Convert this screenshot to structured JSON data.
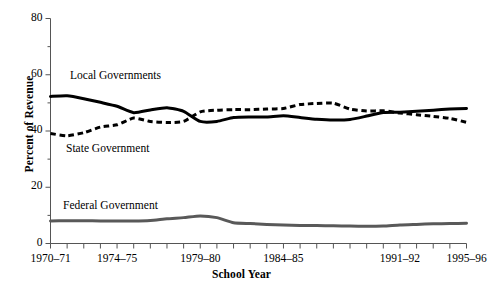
{
  "chart_data": {
    "type": "line",
    "title": "",
    "xlabel": "School Year",
    "ylabel": "Percent of Revenue",
    "ylim": [
      0,
      80
    ],
    "yticks": [
      0,
      20,
      40,
      60,
      80
    ],
    "yminorticks": [
      10,
      30,
      50,
      70
    ],
    "grid": false,
    "legend_position": "inline-annotations",
    "x": [
      "1970-71",
      "1971-72",
      "1972-73",
      "1973-74",
      "1974-75",
      "1975-76",
      "1976-77",
      "1977-78",
      "1978-79",
      "1979-80",
      "1980-81",
      "1981-82",
      "1982-83",
      "1983-84",
      "1984-85",
      "1985-86",
      "1986-87",
      "1987-88",
      "1988-89",
      "1989-90",
      "1990-91",
      "1991-92",
      "1992-93",
      "1993-94",
      "1994-95",
      "1995-96"
    ],
    "xtick_labels": [
      "1970–71",
      "1974–75",
      "1979–80",
      "1984–85",
      "1991–92",
      "1995–96"
    ],
    "xtick_indices": [
      0,
      4,
      9,
      14,
      21,
      25
    ],
    "series": [
      {
        "name": "Local Governments",
        "style": "solid",
        "color": "#000000",
        "width": 3.0,
        "values": [
          52.3,
          52.5,
          51.5,
          50.2,
          48.8,
          46.5,
          47.5,
          48.3,
          47.0,
          43.4,
          43.4,
          44.8,
          45.0,
          45.0,
          45.4,
          44.8,
          44.2,
          43.9,
          44.1,
          45.3,
          46.6,
          46.7,
          47.0,
          47.4,
          47.8,
          48.0
        ]
      },
      {
        "name": "State Government",
        "style": "dashed",
        "color": "#000000",
        "width": 3.0,
        "values": [
          39.1,
          38.3,
          39.4,
          41.4,
          42.2,
          44.6,
          43.4,
          43.0,
          43.4,
          46.8,
          47.4,
          47.6,
          47.6,
          47.8,
          48.0,
          49.4,
          49.8,
          49.9,
          47.8,
          47.1,
          47.2,
          46.4,
          45.8,
          45.2,
          44.5,
          43.1
        ]
      },
      {
        "name": "Federal Government",
        "style": "solid",
        "color": "#595959",
        "width": 3.0,
        "values": [
          8.0,
          8.1,
          8.1,
          8.0,
          8.0,
          8.0,
          8.2,
          8.8,
          9.2,
          9.8,
          9.2,
          7.4,
          7.1,
          6.8,
          6.6,
          6.4,
          6.4,
          6.3,
          6.2,
          6.1,
          6.2,
          6.6,
          6.8,
          7.0,
          7.1,
          7.2
        ]
      }
    ],
    "annotations": [
      {
        "label": "Local Governments",
        "x_px": 70,
        "y_px": 69
      },
      {
        "label": "State Government",
        "x_px": 66,
        "y_px": 142
      },
      {
        "label": "Federal Government",
        "x_px": 63,
        "y_px": 199
      }
    ]
  },
  "axis": {
    "y_title": "Percent of Revenue",
    "x_title": "School Year",
    "ytick_labels": [
      "0",
      "20",
      "40",
      "60",
      "80"
    ]
  }
}
